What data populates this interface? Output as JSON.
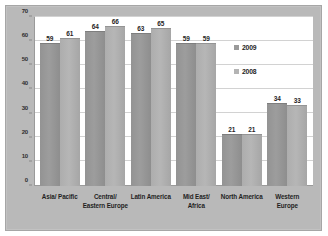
{
  "chart_data": {
    "type": "bar",
    "title": "",
    "subtitle": "",
    "xlabel": "",
    "ylabel": "",
    "ylim": [
      0,
      70
    ],
    "yticks": [
      0,
      10,
      20,
      30,
      40,
      50,
      60,
      70
    ],
    "grid": true,
    "legend_position": "inside-right",
    "categories": [
      "Asia/ Pacific",
      "Central/ Eastern Europe",
      "Latin America",
      "Mid East/ Africa",
      "North America",
      "Western Europe"
    ],
    "category_lines": [
      [
        "Asia/ Pacific"
      ],
      [
        "Central/",
        "Eastern Europe"
      ],
      [
        "Latin America"
      ],
      [
        "Mid East/",
        "Africa"
      ],
      [
        "North America"
      ],
      [
        "Western",
        "Europe"
      ]
    ],
    "series": [
      {
        "name": "2009",
        "color": "#9a9a9a",
        "values": [
          59,
          64,
          63,
          59,
          21,
          34
        ]
      },
      {
        "name": "2008",
        "color": "#b4b4b4",
        "values": [
          61,
          66,
          65,
          59,
          21,
          33
        ]
      }
    ]
  },
  "legend": {
    "items": [
      {
        "label": "2009"
      },
      {
        "label": "2008"
      }
    ]
  },
  "colors": {
    "frame": "#b9b9b9",
    "plot_background": "#ffffff",
    "gridline": "#d2d2d2",
    "axis": "#9a9a9a",
    "text": "#1f1f1f"
  }
}
